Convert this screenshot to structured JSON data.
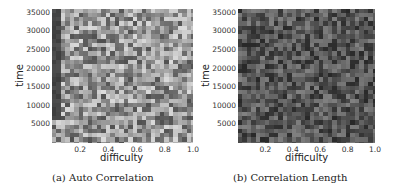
{
  "chart_data": [
    {
      "type": "heatmap",
      "title": "",
      "caption": "(a) Auto Correlation",
      "xlabel": "difficulty",
      "ylabel": "time",
      "xticks": [
        "0.2",
        "0.4",
        "0.6",
        "0.8",
        "1.0"
      ],
      "yticks": [
        "5000",
        "10000",
        "15000",
        "20000",
        "25000",
        "30000",
        "35000"
      ],
      "xlim": [
        0.0,
        1.0
      ],
      "ylim": [
        0,
        36000
      ],
      "colormap": "grayscale",
      "tone": "light gray with dark column near difficulty 0"
    },
    {
      "type": "heatmap",
      "title": "",
      "caption": "(b) Correlation Length",
      "xlabel": "difficulty",
      "ylabel": "time",
      "xticks": [
        "0.2",
        "0.4",
        "0.6",
        "0.8",
        "1.0"
      ],
      "yticks": [
        "5000",
        "10000",
        "15000",
        "20000",
        "25000",
        "30000",
        "35000"
      ],
      "xlim": [
        0.0,
        1.0
      ],
      "ylim": [
        0,
        36000
      ],
      "colormap": "grayscale",
      "tone": "dark gray"
    }
  ]
}
